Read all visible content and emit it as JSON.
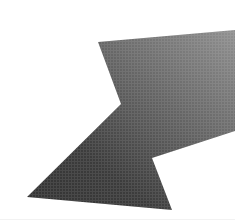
{
  "canvas": {
    "width": 235,
    "height": 223,
    "background_color": "#ffffff"
  },
  "graphic": {
    "name": "arrow-pointing-up-left",
    "description": "Solid halftone arrow pointing toward the upper left",
    "render_style": "halftone-dither",
    "fill_dark_color": "#3a3a3a",
    "fill_mid_color": "#6a6a6a",
    "fill_light_color": "#8e8e8e",
    "gradient_direction": "lower-left-dark-to-upper-right-light",
    "outline": "none",
    "points": [
      {
        "name": "arrowhead-apex",
        "x": 98,
        "y": 42
      },
      {
        "name": "shaft-top-right-edge",
        "x": 235,
        "y": 30
      },
      {
        "name": "shaft-bottom-right-edge",
        "x": 235,
        "y": 131
      },
      {
        "name": "shaft-notch-inner-vertex",
        "x": 121,
        "y": 104
      },
      {
        "name": "arrowhead-right-vertex",
        "x": 152,
        "y": 158
      },
      {
        "name": "arrowhead-bottom-right-vertex",
        "x": 172,
        "y": 210
      },
      {
        "name": "arrowhead-bottom-left-vertex",
        "x": 27,
        "y": 197
      }
    ],
    "path_order": [
      "arrowhead-apex",
      "shaft-top-right-edge",
      "shaft-bottom-right-edge",
      "arrowhead-right-vertex",
      "arrowhead-bottom-right-vertex",
      "arrowhead-bottom-left-vertex"
    ],
    "notch_path": [
      "shaft-bottom-right-edge",
      "shaft-notch-inner-vertex",
      "arrowhead-right-vertex"
    ]
  },
  "baseline": {
    "name": "faint-horizontal-rule",
    "y": 219,
    "color": "#f2f2f2",
    "visible": true
  }
}
